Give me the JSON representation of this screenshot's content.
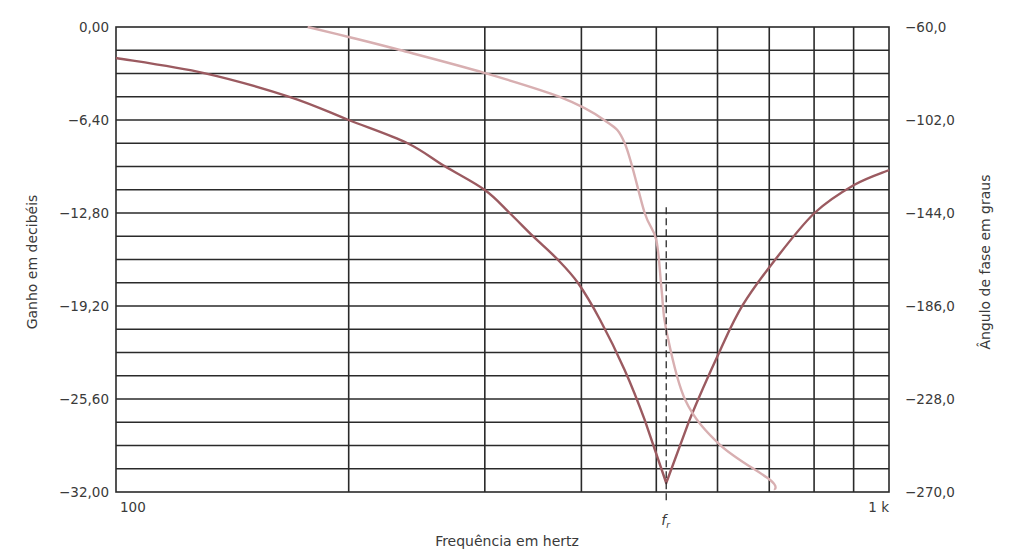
{
  "chart_data": {
    "type": "line",
    "title": "",
    "xlabel": "Frequência em hertz",
    "ylabel": "Ganho em decibéis",
    "y2label": "Ângulo de fase em graus",
    "xscale": "log",
    "xlim": [
      100,
      1000
    ],
    "ylim": [
      -32.0,
      0.0
    ],
    "y2lim": [
      -270.0,
      -60.0
    ],
    "grid": true,
    "x_tick_labels": [
      {
        "value": 100,
        "label": "100"
      },
      {
        "value": 1000,
        "label": "1 k"
      }
    ],
    "x_grid_values": [
      200,
      300,
      400,
      500,
      600,
      700,
      800,
      900
    ],
    "y_tick_labels": [
      "0,00",
      "−6,40",
      "−12,80",
      "−19,20",
      "−25,60",
      "−32,00"
    ],
    "y_tick_values": [
      0.0,
      -6.4,
      -12.8,
      -19.2,
      -25.6,
      -32.0
    ],
    "y2_tick_labels": [
      "−60,0",
      "−102,0",
      "−144,0",
      "−186,0",
      "−228,0",
      "−270,0"
    ],
    "y2_tick_values": [
      -60.0,
      -102.0,
      -144.0,
      -186.0,
      -228.0,
      -270.0
    ],
    "horizontal_grid_divisions": 20,
    "annotation": {
      "label": "f",
      "subscript": "r",
      "x": 515,
      "style": "dashed vertical line",
      "from_value": -12.4
    },
    "series": [
      {
        "name": "Ganho",
        "axis": "left",
        "color": "#9b5a60",
        "x": [
          100,
          130,
          168,
          200,
          238,
          266,
          300,
          323,
          346,
          372,
          396,
          423,
          455,
          483,
          515,
          552,
          605,
          647,
          712,
          801,
          901,
          1000
        ],
        "values": [
          -2.13,
          -3.17,
          -4.82,
          -6.4,
          -7.98,
          -9.57,
          -11.22,
          -12.8,
          -14.38,
          -15.96,
          -17.62,
          -20.16,
          -23.6,
          -27.04,
          -31.38,
          -27.04,
          -22.22,
          -19.13,
          -16.03,
          -12.8,
          -10.87,
          -9.84
        ]
      },
      {
        "name": "Ângulo de fase",
        "axis": "right",
        "color": "#d8afb1",
        "x": [
          177,
          200,
          233,
          300,
          375,
          428,
          455,
          483,
          500,
          508,
          515,
          545,
          605,
          702,
          712
        ],
        "values": [
          -60.0,
          -64.5,
          -70.4,
          -80.8,
          -91.6,
          -102.0,
          -112.4,
          -144.0,
          -156.2,
          -178.8,
          -196.8,
          -228.4,
          -248.8,
          -264.6,
          -269.1
        ]
      }
    ]
  },
  "labels": {
    "xlabel": "Frequência em hertz",
    "ylabel": "Ganho em decibéis",
    "y2label": "Ângulo de fase em graus",
    "fr_main": "f",
    "fr_sub": "r"
  }
}
